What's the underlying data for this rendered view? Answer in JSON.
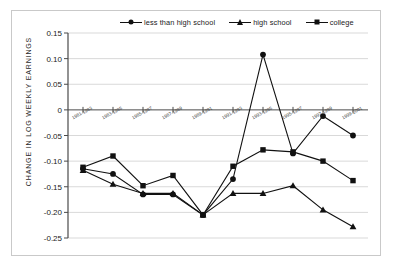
{
  "chart_data": {
    "type": "line",
    "title": "",
    "xlabel": "",
    "ylabel": "CHANGE IN LOG WEEKLY EARNINGS",
    "ylim": [
      -0.25,
      0.15
    ],
    "yticks": [
      "0.15",
      "0.10",
      "0.05",
      "0",
      "-0.05",
      "-0.10",
      "-0.15",
      "-0.20",
      "-0.25"
    ],
    "ytick_values": [
      0.15,
      0.1,
      0.05,
      0,
      -0.05,
      -0.1,
      -0.15,
      -0.2,
      -0.25
    ],
    "grid": true,
    "legend_position": "top",
    "categories": [
      "1981-1983",
      "1983-1985",
      "1985-1987",
      "1987-1989",
      "1989-1991",
      "1991-1993",
      "1993-1995",
      "1995-1997",
      "1997-1999",
      "1999-2001"
    ],
    "series": [
      {
        "name": "less than high school",
        "marker": "circle",
        "values": [
          -0.115,
          -0.125,
          -0.165,
          -0.165,
          -0.205,
          -0.135,
          0.108,
          -0.085,
          -0.012,
          -0.05
        ]
      },
      {
        "name": "high school",
        "marker": "triangle",
        "values": [
          -0.118,
          -0.145,
          -0.163,
          -0.163,
          -0.205,
          -0.163,
          -0.163,
          -0.148,
          -0.195,
          -0.228
        ]
      },
      {
        "name": "college",
        "marker": "square",
        "values": [
          -0.112,
          -0.09,
          -0.148,
          -0.128,
          -0.205,
          -0.11,
          -0.078,
          -0.082,
          -0.1,
          -0.138
        ]
      }
    ]
  },
  "legend": {
    "entries": [
      {
        "label": "less than high school",
        "marker": "circle"
      },
      {
        "label": "high school",
        "marker": "triangle"
      },
      {
        "label": "college",
        "marker": "square"
      }
    ]
  },
  "colors": {
    "series": "#111111",
    "grid": "#d9d9d9",
    "axis": "#4a4a4a",
    "frame": "#c9c9c9",
    "background": "#ffffff"
  }
}
